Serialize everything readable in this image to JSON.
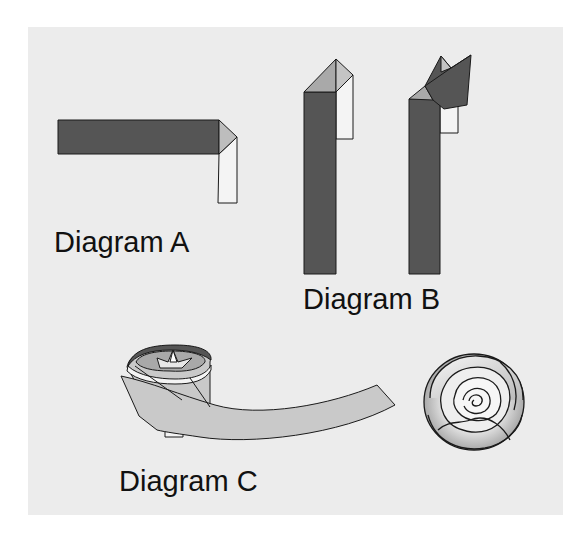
{
  "figure": {
    "panels": [
      {
        "id": "A",
        "label": "Diagram A"
      },
      {
        "id": "B",
        "label": "Diagram B"
      },
      {
        "id": "C",
        "label": "Diagram C"
      }
    ]
  },
  "colors": {
    "background_outer": "#ffffff",
    "background_panel": "#ececec",
    "strip_dark": "#555555",
    "fold_grey": "#a9a9a9",
    "fold_light": "#c4c4c4",
    "strip_back_white": "#f4f4f4",
    "ribbon_grey": "#c9c9c9",
    "outline": "#1a1a1a"
  }
}
